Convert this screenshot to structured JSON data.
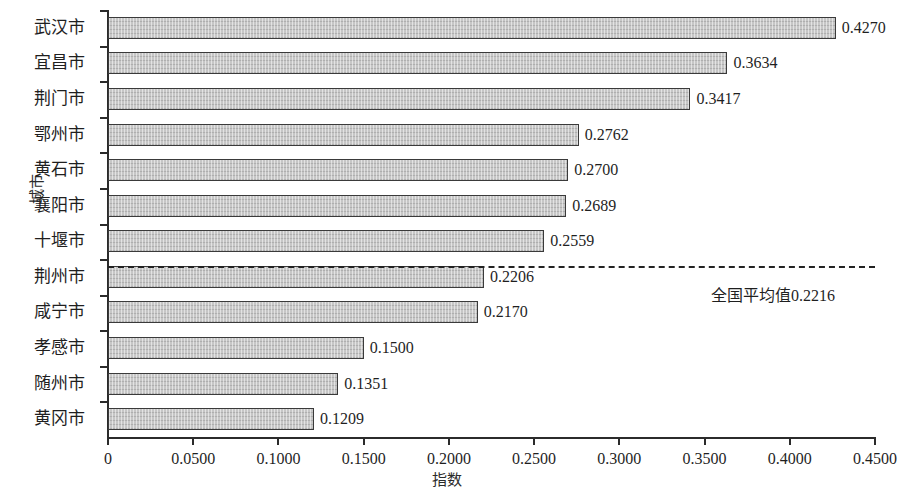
{
  "chart_data": {
    "type": "bar",
    "orientation": "horizontal",
    "title": "",
    "xlabel": "指数",
    "ylabel": "城市",
    "xlim": [
      0,
      0.45
    ],
    "grid": false,
    "legend": null,
    "categories": [
      "武汉市",
      "宜昌市",
      "荆门市",
      "鄂州市",
      "黄石市",
      "襄阳市",
      "十堰市",
      "荆州市",
      "咸宁市",
      "孝感市",
      "随州市",
      "黄冈市"
    ],
    "values": [
      0.427,
      0.3634,
      0.3417,
      0.2762,
      0.27,
      0.2689,
      0.2559,
      0.2206,
      0.217,
      0.15,
      0.1351,
      0.1209
    ],
    "value_labels": [
      "0.4270",
      "0.3634",
      "0.3417",
      "0.2762",
      "0.2700",
      "0.2689",
      "0.2559",
      "0.2206",
      "0.2170",
      "0.1500",
      "0.1351",
      "0.1209"
    ],
    "xticks": [
      0,
      0.05,
      0.1,
      0.15,
      0.2,
      0.25,
      0.3,
      0.35,
      0.4,
      0.45
    ],
    "xtick_labels": [
      "0",
      "0.0500",
      "0.1000",
      "0.1500",
      "0.2000",
      "0.2500",
      "0.3000",
      "0.3500",
      "0.4000",
      "0.4500"
    ],
    "annotations": [
      {
        "name": "national-average",
        "label": "全国平均值0.2216",
        "value": 0.2216,
        "style": "dashed-horizontal-line",
        "anchor_category": "荆州市"
      }
    ],
    "colors": {
      "bar_fill": "#c6c6c6",
      "bar_border": "#3a3a3a",
      "axis": "#2b2b2b",
      "text": "#1f1f1f",
      "annotation_line": "#222222"
    }
  }
}
